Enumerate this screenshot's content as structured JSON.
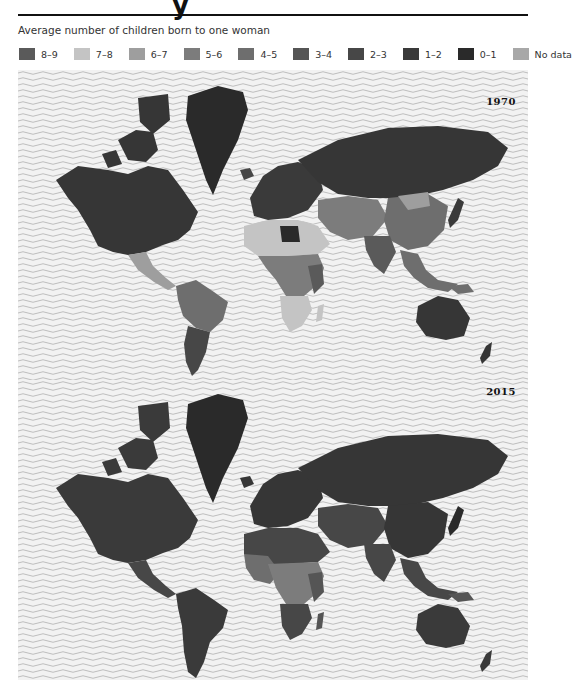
{
  "header": {
    "title_fragment": "y",
    "subtitle": "Average number of children born to one woman"
  },
  "legend": {
    "items": [
      {
        "label": "8–9",
        "color": "#5a5a5a"
      },
      {
        "label": "7–8",
        "color": "#c4c4c4"
      },
      {
        "label": "6–7",
        "color": "#9e9e9e"
      },
      {
        "label": "5–6",
        "color": "#7c7c7c"
      },
      {
        "label": "4–5",
        "color": "#6e6e6e"
      },
      {
        "label": "3–4",
        "color": "#555555"
      },
      {
        "label": "2–3",
        "color": "#474747"
      },
      {
        "label": "1–2",
        "color": "#3a3a3a"
      },
      {
        "label": "0–1",
        "color": "#2a2a2a"
      },
      {
        "label": "No data",
        "color": "#a8a8a8"
      }
    ]
  },
  "maps": [
    {
      "year": "1970"
    },
    {
      "year": "2015"
    }
  ],
  "colors": {
    "ocean_bg": "#f2f2f2",
    "ocean_wave": "#b8b8b8",
    "land_low": "#363636"
  }
}
